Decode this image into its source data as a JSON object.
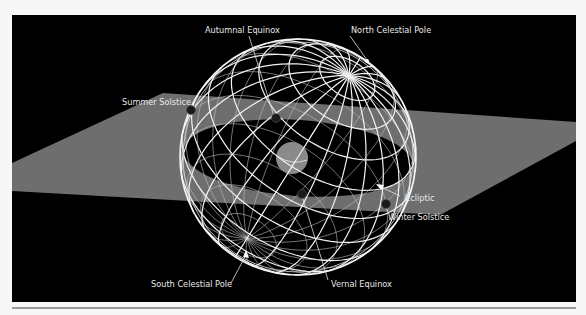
{
  "diagram": {
    "colors": {
      "background": "#000000",
      "page": "#f7f7f7",
      "plane": "#6e6e6e",
      "grid": "#f2f2f2",
      "sun": "#8a8a8a",
      "point": "#1a1a1a"
    },
    "labels": {
      "autumnal_equinox": "Autumnal Equinox",
      "north_celestial_pole": "North Celestial Pole",
      "summer_solstice": "Summer Solstice",
      "ecliptic": "Ecliptic",
      "winter_solstice": "Winter Solstice",
      "south_celestial_pole": "South Celestial Pole",
      "vernal_equinox": "Vernal Equinox"
    }
  }
}
